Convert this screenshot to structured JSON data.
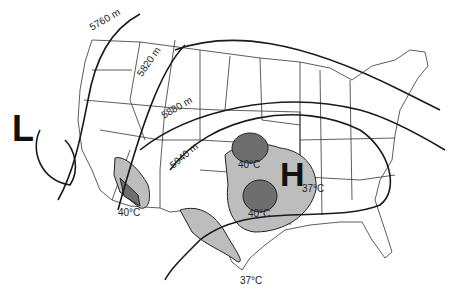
{
  "map": {
    "title": "",
    "pressure_centers": [
      {
        "symbol": "L",
        "meaning": "low-pressure"
      },
      {
        "symbol": "H",
        "meaning": "high-pressure"
      }
    ],
    "contours": [
      {
        "label": "5760 m"
      },
      {
        "label": "5820 m"
      },
      {
        "label": "5880 m"
      },
      {
        "label": "5940 m"
      }
    ],
    "temperature_labels": [
      {
        "label": "40°C",
        "location": "southwest-california-arizona"
      },
      {
        "label": "40°C",
        "location": "kansas"
      },
      {
        "label": "40°C",
        "location": "oklahoma-texas"
      },
      {
        "label": "37°C",
        "location": "arkansas-tennessee"
      },
      {
        "label": "37°C",
        "location": "south-texas"
      }
    ],
    "colors": {
      "light_shade": "#bdbdbd",
      "dark_shade": "#6e6e6e",
      "line": "#1a1a1a",
      "state_border": "#333333"
    }
  }
}
